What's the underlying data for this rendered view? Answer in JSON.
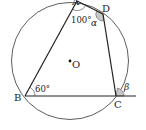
{
  "diagram": {
    "type": "cyclic-quadrilateral",
    "circle": {
      "center_label": "O"
    },
    "points": {
      "A": "A",
      "B": "B",
      "C": "C",
      "D": "D"
    },
    "angles": {
      "A": "100°",
      "B": "60°",
      "D": "α",
      "C_exterior": "β"
    },
    "colors": {
      "stroke": "#222222",
      "angle_fill": "#c8c8c8"
    }
  }
}
